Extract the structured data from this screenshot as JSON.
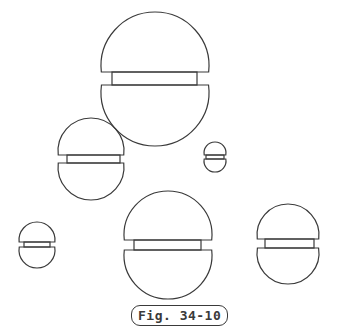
{
  "figure": {
    "caption": "Fig. 34-10",
    "stroke_color": "#3a3a3a",
    "screws": [
      {
        "name": "large-top",
        "cx": 155,
        "cy": 78,
        "r": 54,
        "slot_top": 72,
        "slot_bottom": 85,
        "slot_x1": 112,
        "slot_x2": 197
      },
      {
        "name": "medium-left",
        "cx": 91,
        "cy": 159,
        "r": 33,
        "slot_top": 155,
        "slot_bottom": 163,
        "slot_x1": 67,
        "slot_x2": 120
      },
      {
        "name": "small-center",
        "cx": 215,
        "cy": 157,
        "r": 11,
        "slot_top": 155,
        "slot_bottom": 159,
        "slot_x1": 206,
        "slot_x2": 224
      },
      {
        "name": "small-left",
        "cx": 37,
        "cy": 244,
        "r": 18,
        "slot_top": 242,
        "slot_bottom": 247,
        "slot_x1": 24,
        "slot_x2": 50
      },
      {
        "name": "large-bottom",
        "cx": 168,
        "cy": 245,
        "r": 44,
        "slot_top": 240,
        "slot_bottom": 250,
        "slot_x1": 134,
        "slot_x2": 201
      },
      {
        "name": "medium-right",
        "cx": 288,
        "cy": 243,
        "r": 31,
        "slot_top": 239,
        "slot_bottom": 248,
        "slot_x1": 265,
        "slot_x2": 314
      }
    ]
  }
}
